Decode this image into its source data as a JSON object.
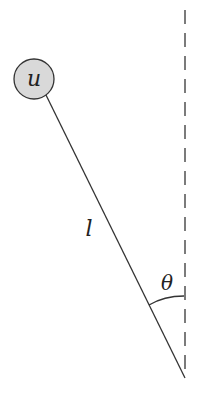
{
  "diagram": {
    "type": "pendulum",
    "bob": {
      "label": "u",
      "fill": "#d9d9d9",
      "stroke": "#333333",
      "cx": 34,
      "cy": 79,
      "r": 20
    },
    "rod": {
      "label": "l",
      "x1": 46,
      "y1": 95,
      "x2": 185,
      "y2": 378
    },
    "pivot": {
      "x": 185,
      "y": 378
    },
    "vertical_reference": {
      "style": "dashed",
      "x": 185,
      "y1": 10,
      "y2": 378
    },
    "angle": {
      "label": "θ"
    }
  }
}
